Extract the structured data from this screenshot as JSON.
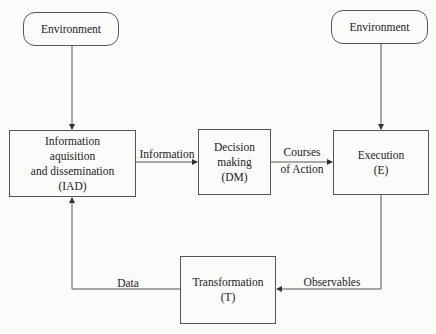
{
  "nodes": {
    "env_left": {
      "label": "Environment"
    },
    "env_right": {
      "label": "Environment"
    },
    "iad": {
      "lines": [
        "Information",
        "aquisition",
        "and dissemination",
        "(IAD)"
      ]
    },
    "dm": {
      "lines": [
        "Decision",
        "making",
        "(DM)"
      ]
    },
    "exec": {
      "lines": [
        "Execution",
        "(E)"
      ]
    },
    "transform": {
      "lines": [
        "Transformation",
        "(T)"
      ]
    }
  },
  "edges": {
    "iad_to_dm": {
      "label": "Information"
    },
    "dm_to_exec": {
      "lines": [
        "Courses",
        "of Action"
      ]
    },
    "exec_to_transform": {
      "label": "Observables"
    },
    "transform_to_iad": {
      "label": "Data"
    }
  },
  "colors": {
    "line": "#555555",
    "text": "#222222",
    "background": "#fbfbfa"
  }
}
